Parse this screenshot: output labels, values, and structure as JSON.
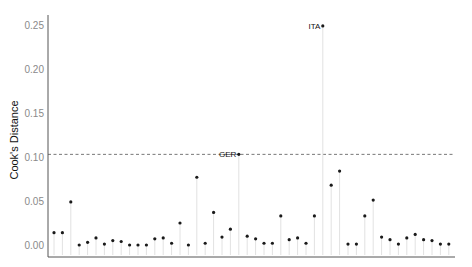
{
  "chart_data": {
    "type": "scatter",
    "subtype": "lollipop",
    "title": "",
    "xlabel": "",
    "ylabel": "Cook's Distance",
    "ylim": [
      -0.012,
      0.262
    ],
    "yticks": [
      0.0,
      0.05,
      0.1,
      0.15,
      0.2,
      0.25
    ],
    "ytick_labels": [
      "0.00",
      "0.05",
      "0.10",
      "0.15",
      "0.20",
      "0.25"
    ],
    "grid": false,
    "legend": "none",
    "threshold": {
      "value": 0.103,
      "style": "dashed"
    },
    "annotations": [
      {
        "label": "ITA",
        "index": 32
      },
      {
        "label": "GER",
        "index": 22
      }
    ],
    "x": [
      1,
      2,
      3,
      4,
      5,
      6,
      7,
      8,
      9,
      10,
      11,
      12,
      13,
      14,
      15,
      16,
      17,
      18,
      19,
      20,
      21,
      22,
      23,
      24,
      25,
      26,
      27,
      28,
      29,
      30,
      31,
      32,
      33,
      34,
      35,
      36,
      37,
      38,
      39,
      40,
      41,
      42,
      43,
      44,
      45,
      46,
      47,
      48
    ],
    "values": [
      0.014,
      0.014,
      0.049,
      0.0,
      0.003,
      0.008,
      0.001,
      0.005,
      0.004,
      0.0,
      0.0,
      0.0,
      0.007,
      0.008,
      0.002,
      0.025,
      0.0,
      0.077,
      0.002,
      0.037,
      0.009,
      0.018,
      0.103,
      0.01,
      0.007,
      0.002,
      0.002,
      0.033,
      0.006,
      0.008,
      0.002,
      0.033,
      0.249,
      0.068,
      0.084,
      0.001,
      0.001,
      0.033,
      0.051,
      0.009,
      0.006,
      0.001,
      0.008,
      0.012,
      0.006,
      0.005,
      0.001,
      0.001
    ]
  },
  "colors": {
    "point": "#1a1a1a",
    "stem": "#e2e2e2",
    "axis": "#555555",
    "threshold": "#555555",
    "tick_text": "#8a8a8a"
  }
}
